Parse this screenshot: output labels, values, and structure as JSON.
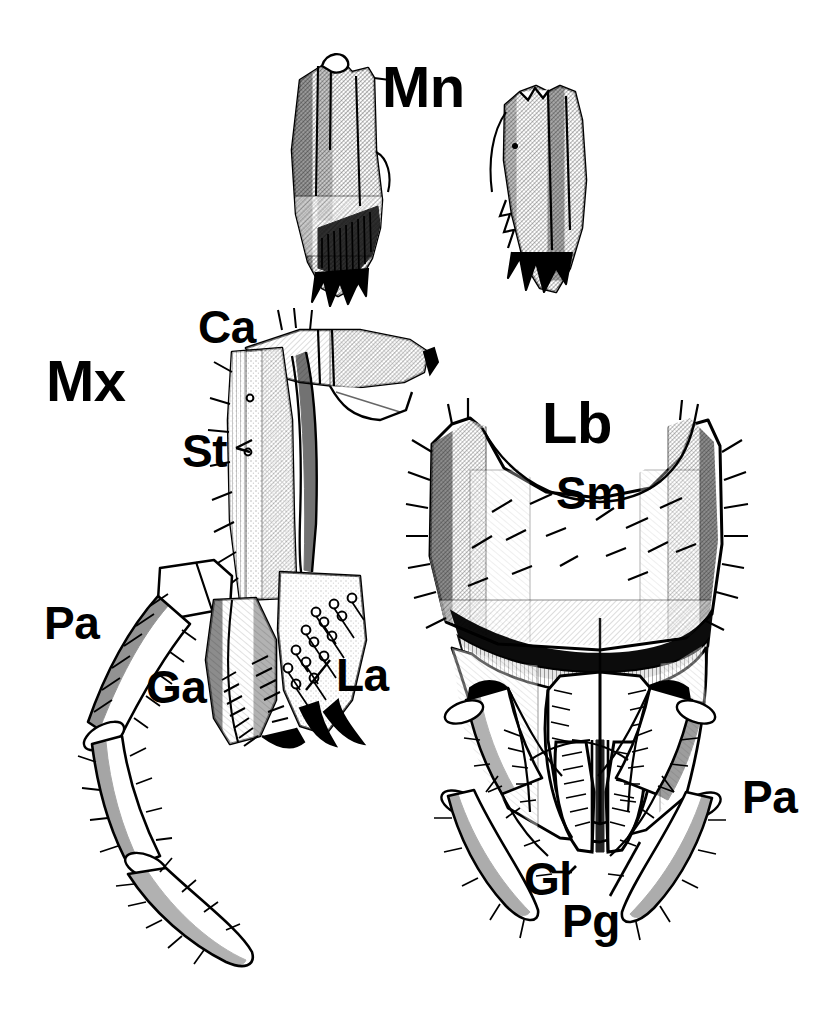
{
  "figure": {
    "domain": "scientific-illustration",
    "technique": "stippled / cross-hatched pen-and-ink",
    "background_color": "#ffffff",
    "ink_color": "#000000",
    "width": 828,
    "height": 1019
  },
  "panels": [
    {
      "id": "mandibles",
      "label": "Mn",
      "title": "Mandibles",
      "label_x": 382,
      "label_y": 58,
      "label_size": "lbl-lg",
      "parts": [
        "left mandible with molar teeth",
        "right mandible with incisor teeth"
      ]
    },
    {
      "id": "maxilla",
      "label": "Mx",
      "title": "Maxilla",
      "label_x": 46,
      "label_y": 352,
      "label_size": "lbl-lg",
      "parts": [
        "cardo",
        "stipes",
        "palp",
        "galea",
        "lacinia"
      ]
    },
    {
      "id": "labium",
      "label": "Lb",
      "title": "Labium",
      "label_x": 542,
      "label_y": 394,
      "label_size": "lbl-lg",
      "parts": [
        "submentum",
        "glossa",
        "paraglossa",
        "palp"
      ]
    }
  ],
  "annotations": [
    {
      "key": "Ca",
      "text": "Ca",
      "meaning": "cardo",
      "x": 198,
      "y": 304,
      "size": "lbl-md",
      "leader": false
    },
    {
      "key": "St",
      "text": "St",
      "meaning": "stipes",
      "x": 182,
      "y": 428,
      "size": "lbl-md",
      "leader": true
    },
    {
      "key": "Pa1",
      "text": "Pa",
      "meaning": "palp",
      "x": 44,
      "y": 600,
      "size": "lbl-md",
      "leader": false
    },
    {
      "key": "Ga",
      "text": "Ga",
      "meaning": "galea",
      "x": 146,
      "y": 664,
      "size": "lbl-md",
      "leader": false
    },
    {
      "key": "La",
      "text": "La",
      "meaning": "lacinia",
      "x": 336,
      "y": 652,
      "size": "lbl-md",
      "leader": true
    },
    {
      "key": "Sm",
      "text": "Sm",
      "meaning": "submentum",
      "x": 556,
      "y": 470,
      "size": "lbl-md",
      "leader": false
    },
    {
      "key": "Pa2",
      "text": "Pa",
      "meaning": "palp",
      "x": 742,
      "y": 774,
      "size": "lbl-md",
      "leader": false
    },
    {
      "key": "Gl",
      "text": "Gl",
      "meaning": "glossa",
      "x": 524,
      "y": 856,
      "size": "lbl-md",
      "leader": true
    },
    {
      "key": "Pg",
      "text": "Pg",
      "meaning": "paraglossa",
      "x": 562,
      "y": 898,
      "size": "lbl-md",
      "leader": true
    }
  ],
  "legend_keys": {
    "Mn": "mandible",
    "Mx": "maxilla",
    "Lb": "labium",
    "Ca": "cardo",
    "St": "stipes",
    "Pa": "palp",
    "Ga": "galea",
    "La": "lacinia",
    "Sm": "submentum",
    "Gl": "glossa",
    "Pg": "paraglossa"
  }
}
